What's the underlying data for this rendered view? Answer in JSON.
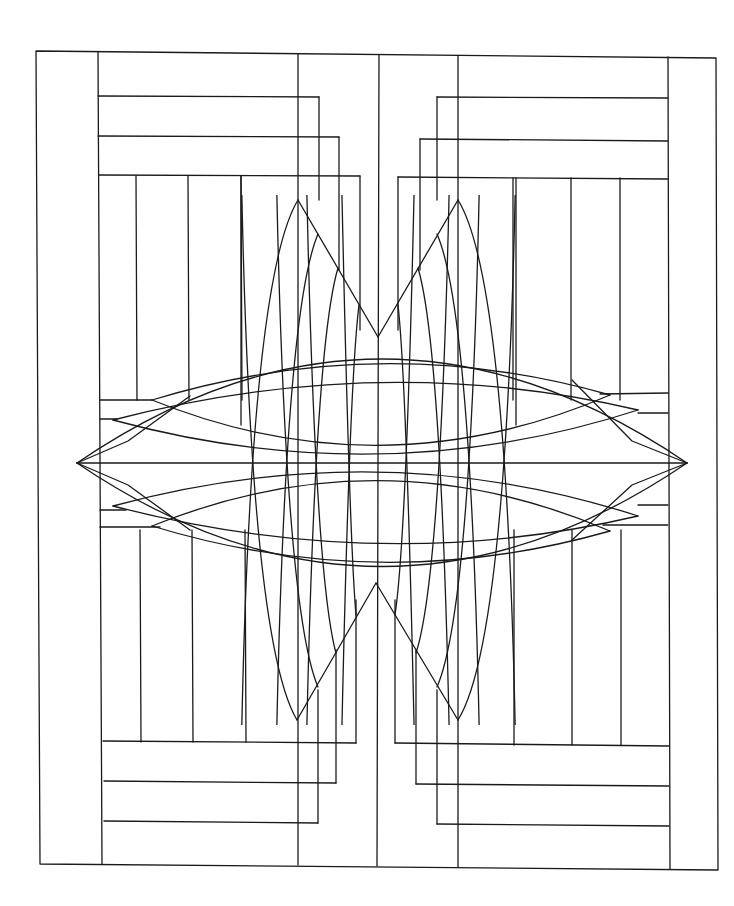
{
  "artwork": {
    "kind": "geometric line drawing",
    "ink_color": "#1a1a1a",
    "paper_color": "#ffffff",
    "symmetry": "four-fold (mirrored horizontally and vertically)",
    "motifs": [
      "outer frame",
      "nested L-shaped bands",
      "vertical stripe panels",
      "pointed arch fans",
      "horizontal lens weave"
    ]
  }
}
